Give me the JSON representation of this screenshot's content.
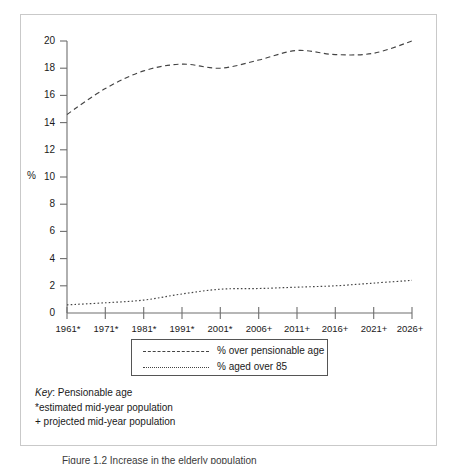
{
  "figure": {
    "y_axis_unit_label": "%",
    "y_ticks": [
      "20",
      "18",
      "16",
      "14",
      "12",
      "10",
      "8",
      "6",
      "4",
      "2",
      "0"
    ],
    "x_ticks": [
      "1961*",
      "1971*",
      "1981*",
      "1991*",
      "2001*",
      "2006+",
      "2011+",
      "2016+",
      "2021+",
      "2026+"
    ],
    "legend": [
      {
        "label": "% over pensionable age",
        "style": "dashed"
      },
      {
        "label": "% aged over 85",
        "style": "dotted"
      }
    ],
    "key": {
      "word": "Key",
      "line1_rest": ": Pensionable age",
      "line2": "*estimated mid-year population",
      "line3": "+ projected mid-year population"
    },
    "caption": "Figure 1.2 Increase in the elderly population"
  },
  "colors": {
    "line": "#444444",
    "axis": "#6e6e6e",
    "frame": "#c9c9c9",
    "text": "#1a1a1a"
  },
  "chart_data": {
    "type": "line",
    "title": "",
    "xlabel": "",
    "ylabel": "%",
    "ylim": [
      0,
      20
    ],
    "yticks": [
      0,
      2,
      4,
      6,
      8,
      10,
      12,
      14,
      16,
      18,
      20
    ],
    "grid": false,
    "legend_position": "below-axes",
    "categories": [
      "1961*",
      "1971*",
      "1981*",
      "1991*",
      "2001*",
      "2006+",
      "2011+",
      "2016+",
      "2021+",
      "2026+"
    ],
    "series": [
      {
        "name": "% over pensionable age",
        "style": "dashed",
        "values": [
          14.6,
          16.5,
          17.8,
          18.3,
          18.0,
          18.6,
          19.3,
          19.0,
          19.1,
          20.0
        ]
      },
      {
        "name": "% aged over 85",
        "style": "dotted",
        "values": [
          0.6,
          0.75,
          0.95,
          1.4,
          1.75,
          1.8,
          1.9,
          2.0,
          2.2,
          2.4
        ]
      }
    ],
    "annotations": [
      "*estimated mid-year population",
      "+ projected mid-year population",
      "Key: Pensionable age"
    ]
  }
}
